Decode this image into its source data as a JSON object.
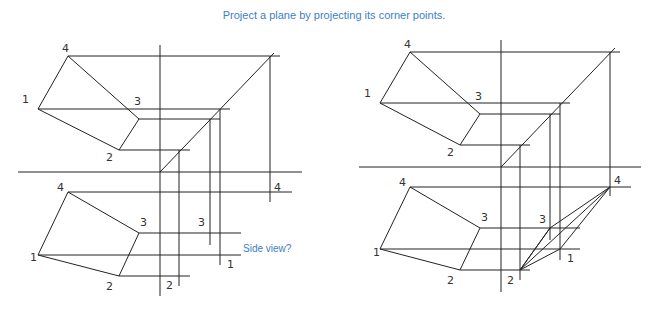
{
  "title": "Project a plane by projecting its corner points.",
  "annotation": "Side view?",
  "labels": {
    "p1": "1",
    "p2": "2",
    "p3": "3",
    "p4": "4"
  }
}
